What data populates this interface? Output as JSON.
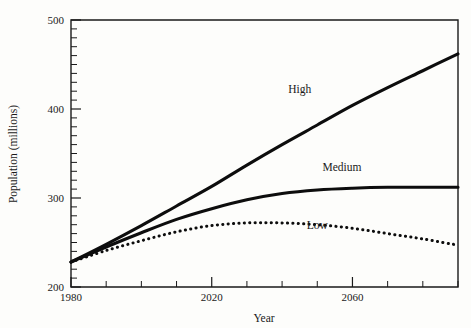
{
  "chart_data": {
    "type": "line",
    "title": "",
    "xlabel": "Year",
    "ylabel": "Population (millions)",
    "xlim": [
      1980,
      2090
    ],
    "ylim": [
      200,
      500
    ],
    "grid": false,
    "legend_position": "inline-annotations",
    "x_ticks_major": [
      1980,
      2020,
      2060
    ],
    "x_tick_labels": [
      "1980",
      "2020",
      "2060"
    ],
    "x_tick_minor_step": 10,
    "y_ticks_major": [
      200,
      300,
      400,
      500
    ],
    "y_tick_labels": [
      "200",
      "300",
      "400",
      "500"
    ],
    "y_tick_minor_step": 10,
    "x": [
      1980,
      1990,
      2000,
      2010,
      2020,
      2030,
      2040,
      2050,
      2060,
      2070,
      2080,
      2090
    ],
    "series": [
      {
        "name": "High",
        "style": "solid",
        "label": "High",
        "values": [
          228,
          248,
          269,
          291,
          313,
          337,
          360,
          382,
          404,
          424,
          443,
          462
        ]
      },
      {
        "name": "Medium",
        "style": "solid",
        "label": "Medium",
        "values": [
          228,
          245,
          261,
          276,
          288,
          298,
          305,
          309,
          311,
          312,
          312,
          312
        ]
      },
      {
        "name": "Low",
        "style": "dotted",
        "label": "Low",
        "values": [
          228,
          241,
          252,
          262,
          269,
          272,
          272,
          270,
          266,
          260,
          254,
          247
        ]
      }
    ],
    "annotations": [
      {
        "text": "High",
        "x": 2045,
        "y": 418
      },
      {
        "text": "Medium",
        "x": 2057,
        "y": 330
      },
      {
        "text": "Low",
        "x": 2050,
        "y": 265
      }
    ],
    "colors": {
      "ink": "#0d0d0d",
      "axis": "#1a1a1a",
      "background": "#fdfdfb"
    }
  }
}
